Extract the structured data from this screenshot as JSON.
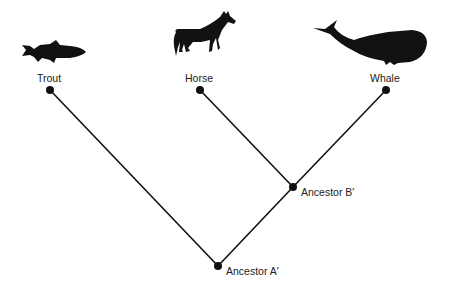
{
  "diagram": {
    "type": "cladogram",
    "taxa": [
      {
        "label": "Trout",
        "icon": "fish-icon"
      },
      {
        "label": "Horse",
        "icon": "horse-icon"
      },
      {
        "label": "Whale",
        "icon": "whale-icon"
      }
    ],
    "nodes": [
      {
        "label": "Ancestor B′"
      },
      {
        "label": "Ancestor A′"
      }
    ],
    "colors": {
      "line": "#111111",
      "silhouette": "#111111",
      "background": "#ffffff"
    }
  }
}
